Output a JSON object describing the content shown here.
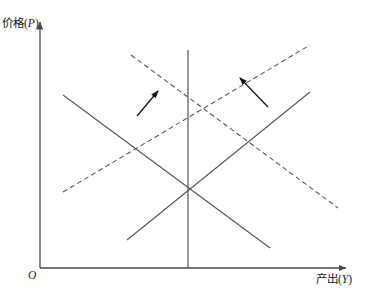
{
  "figure": {
    "type": "economics-diagram",
    "background_color": "#ffffff",
    "line_color": "#555555",
    "arrow_color": "#111111",
    "text_color": "#1a1a1a"
  },
  "axes": {
    "y_label_text": "价格(",
    "y_label_var": "P",
    "y_label_close": ")",
    "x_label_text": "产出(",
    "x_label_var": "Y",
    "x_label_close": ")",
    "origin_label": "O",
    "y_axis": {
      "x": 40,
      "top": 20,
      "bottom": 268
    },
    "x_axis": {
      "y": 268,
      "left": 40,
      "right": 348
    }
  },
  "chart_data": {
    "type": "line",
    "title": "",
    "xlabel": "产出(Y)",
    "ylabel": "价格(P)",
    "grid": false,
    "legend": "none",
    "xlim": [
      40,
      348
    ],
    "ylim": [
      268,
      20
    ],
    "series": [
      {
        "name": "long-run-aggregate-supply",
        "style": "solid",
        "points": [
          [
            188,
            50
          ],
          [
            188,
            268
          ]
        ]
      },
      {
        "name": "aggregate-demand-initial",
        "style": "solid",
        "points": [
          [
            63,
            95
          ],
          [
            270,
            248
          ]
        ]
      },
      {
        "name": "short-run-aggregate-supply-initial",
        "style": "solid",
        "points": [
          [
            127,
            240
          ],
          [
            310,
            92
          ]
        ]
      },
      {
        "name": "aggregate-demand-shifted",
        "style": "dashed",
        "points": [
          [
            131,
            55
          ],
          [
            338,
            208
          ]
        ]
      },
      {
        "name": "short-run-aggregate-supply-shifted",
        "style": "dashed",
        "points": [
          [
            63,
            192
          ],
          [
            310,
            45
          ]
        ]
      }
    ],
    "annotations": [
      {
        "name": "shift-arrow-left",
        "style": "arrow",
        "from": [
          137,
          116
        ],
        "to": [
          158,
          91
        ]
      },
      {
        "name": "shift-arrow-right",
        "style": "arrow",
        "from": [
          268,
          107
        ],
        "to": [
          240,
          78
        ]
      }
    ],
    "intersections": [
      {
        "name": "initial-equilibrium",
        "point": [
          188,
          190
        ]
      },
      {
        "name": "new-equilibrium",
        "point": [
          188,
          93
        ]
      }
    ]
  }
}
